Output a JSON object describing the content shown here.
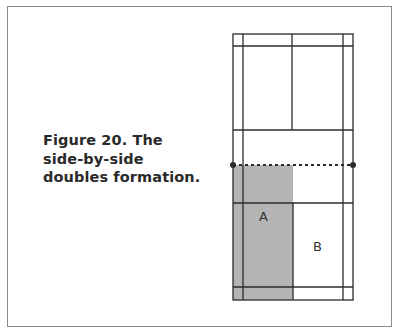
{
  "figure": {
    "caption_lines": [
      "Figure 20. The",
      "side-by-side",
      "doubles formation."
    ],
    "caption": "Figure 20. The side-by-side doubles formation."
  },
  "court": {
    "player_labels": [
      "A",
      "B"
    ],
    "shaded_zone_player": "A",
    "colors": {
      "line": "#2b2b2b",
      "shaded": "#b4b4b4",
      "frame": "#8a8a8a",
      "background": "#ffffff"
    },
    "net": {
      "style": "dotted",
      "posts": 2
    }
  }
}
